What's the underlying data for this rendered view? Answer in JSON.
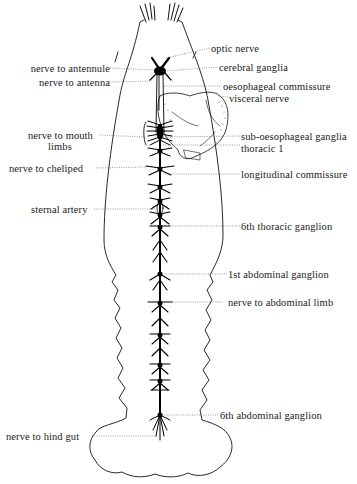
{
  "figure": {
    "colors": {
      "ink": "#111111",
      "leader": "#555555",
      "background": "#ffffff"
    }
  },
  "labels_left": [
    {
      "id": "nerve-to-antennule",
      "text": "nerve to antennule"
    },
    {
      "id": "nerve-to-antenna",
      "text": "nerve to antenna"
    },
    {
      "id": "nerve-to-mouth-limbs",
      "text": "nerve to mouth",
      "text2": "limbs"
    },
    {
      "id": "nerve-to-cheliped",
      "text": "nerve to cheliped"
    },
    {
      "id": "sternal-artery",
      "text": "sternal artery"
    },
    {
      "id": "nerve-to-hind-gut",
      "text": "nerve to hind gut"
    }
  ],
  "labels_right": [
    {
      "id": "optic-nerve",
      "text": "optic nerve"
    },
    {
      "id": "cerebral-ganglia",
      "text": "cerebral ganglia"
    },
    {
      "id": "oesophageal-commissure",
      "text": "oesophageal commissure"
    },
    {
      "id": "visceral-nerve",
      "text": "visceral nerve"
    },
    {
      "id": "sub-oesophageal-ganglia",
      "text": "sub-oesophageal ganglia"
    },
    {
      "id": "thoracic-1",
      "text": "thoracic  1"
    },
    {
      "id": "longitudinal-commissure",
      "text": "longitudinal commissure"
    },
    {
      "id": "6th-thoracic-ganglion",
      "text": "6th thoracic ganglion"
    },
    {
      "id": "1st-abdominal-ganglion",
      "text": "1st abdominal ganglion"
    },
    {
      "id": "nerve-to-abdominal-limb",
      "text": "nerve to abdominal limb"
    },
    {
      "id": "6th-abdominal-ganglion",
      "text": "6th abdominal ganglion"
    }
  ]
}
